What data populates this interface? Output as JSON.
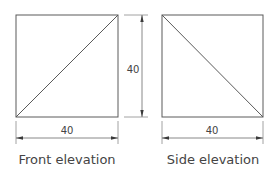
{
  "front_view": {
    "caption": "Front elevation",
    "width_dimension": "40",
    "height_dimension": "40",
    "diagonal": "bottom-left to top-right"
  },
  "side_view": {
    "caption": "Side elevation",
    "width_dimension": "40",
    "diagonal": "top-left to bottom-right"
  },
  "colors": {
    "line": "#5a5a5a",
    "text": "#444444",
    "background": "#ffffff"
  }
}
